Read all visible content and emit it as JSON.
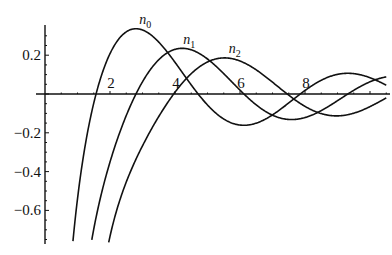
{
  "chart_data": {
    "type": "line",
    "title": "",
    "xlabel": "",
    "ylabel": "",
    "xlim": [
      0,
      10.6
    ],
    "ylim": [
      -0.77,
      0.36
    ],
    "grid": false,
    "legend": "inline curve labels",
    "x_ticks": [
      2,
      4,
      6,
      8
    ],
    "x_tick_labels": [
      "2",
      "4",
      "6",
      "8"
    ],
    "y_ticks": [
      0.2,
      -0.2,
      -0.4,
      -0.6
    ],
    "y_tick_labels": [
      "0.2",
      "−0.2",
      "−0.4",
      "−0.6"
    ],
    "x": [
      1,
      1.5,
      2,
      2.5,
      3,
      3.5,
      4,
      4.5,
      5,
      5.5,
      6,
      6.5,
      7,
      7.5,
      8,
      8.5,
      9,
      9.5,
      10,
      10.5
    ],
    "series": [
      {
        "name": "n0",
        "label_main": "n",
        "label_sub": "0",
        "label_x": 2.9,
        "label_y": 0.36,
        "values": [
          -0.54,
          -0.047,
          0.208,
          0.32,
          0.33,
          0.268,
          0.163,
          0.047,
          -0.057,
          -0.129,
          -0.16,
          -0.15,
          -0.108,
          -0.046,
          0.018,
          0.07,
          0.101,
          0.105,
          0.084,
          0.045
        ]
      },
      {
        "name": "n1",
        "label_main": "n",
        "label_sub": "1",
        "label_x": 4.25,
        "label_y": 0.26,
        "values": [
          -1.382,
          -0.696,
          -0.35,
          -0.11,
          0.063,
          0.167,
          0.23,
          0.228,
          0.18,
          0.107,
          0.02,
          -0.061,
          -0.109,
          -0.131,
          -0.13,
          -0.102,
          -0.056,
          -0.003,
          0.046,
          0.083
        ]
      },
      {
        "name": "n2",
        "label_main": "n",
        "label_sub": "2",
        "label_x": 5.65,
        "label_y": 0.21,
        "values": [
          -3.61,
          -1.26,
          -0.74,
          -0.46,
          -0.262,
          -0.084,
          0.057,
          0.149,
          0.182,
          0.174,
          0.138,
          0.066,
          -0.008,
          -0.076,
          -0.121,
          -0.134,
          -0.118,
          -0.08,
          -0.031,
          0.02
        ]
      }
    ]
  }
}
